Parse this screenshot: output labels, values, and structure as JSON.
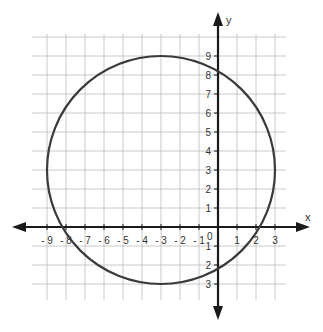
{
  "chart_data": {
    "type": "scatter",
    "title": "",
    "xlabel": "x",
    "ylabel": "y",
    "xlim": [
      -10,
      4
    ],
    "ylim": [
      -4,
      10
    ],
    "grid": true,
    "x_ticks": [
      -9,
      -8,
      -7,
      -6,
      -5,
      -4,
      -3,
      -2,
      -1,
      1,
      2,
      3
    ],
    "y_ticks": [
      -3,
      -2,
      -1,
      1,
      2,
      3,
      4,
      5,
      6,
      7,
      8,
      9
    ],
    "origin_label": "0",
    "shapes": [
      {
        "kind": "circle",
        "center": [
          -3,
          3
        ],
        "radius": 6,
        "stroke": "#3a3a3a"
      }
    ],
    "series": [
      {
        "name": "circle",
        "equation": "(x+3)^2 + (y-3)^2 = 36"
      }
    ]
  },
  "labels": {
    "x": "x",
    "y": "y",
    "origin": "0"
  },
  "colors": {
    "axis": "#1a1a1a",
    "grid": "#bdbdbd",
    "curve": "#3a3a3a"
  }
}
